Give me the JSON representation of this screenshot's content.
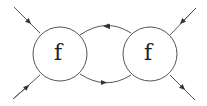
{
  "diagram": {
    "type": "feynman-loop",
    "nodes": [
      {
        "id": "left",
        "label": "f"
      },
      {
        "id": "right",
        "label": "f"
      }
    ],
    "edges": [
      {
        "from": "external-top-left",
        "to": "left",
        "direction": "in"
      },
      {
        "from": "external-bottom-left",
        "to": "left",
        "direction": "in"
      },
      {
        "from": "right",
        "to": "left",
        "path": "upper-arc"
      },
      {
        "from": "left",
        "to": "right",
        "path": "lower-arc"
      },
      {
        "from": "external-top-right",
        "to": "right",
        "direction": "in"
      },
      {
        "from": "right",
        "to": "external-bottom-right",
        "direction": "out"
      }
    ],
    "colors": {
      "stroke": "#555555",
      "text": "#222222"
    }
  }
}
